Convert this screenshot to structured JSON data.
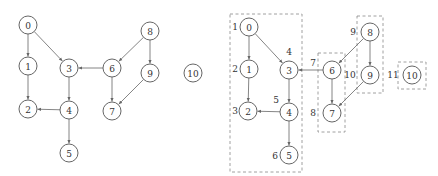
{
  "colors": {
    "node_stroke": "#555555",
    "edge": "#666666",
    "box": "#888888",
    "text": "#333333"
  },
  "left_graph": {
    "nodes": [
      {
        "id": "0",
        "x": 28,
        "y": 25
      },
      {
        "id": "1",
        "x": 28,
        "y": 66
      },
      {
        "id": "2",
        "x": 28,
        "y": 109
      },
      {
        "id": "3",
        "x": 69,
        "y": 68
      },
      {
        "id": "4",
        "x": 69,
        "y": 110
      },
      {
        "id": "5",
        "x": 69,
        "y": 153
      },
      {
        "id": "6",
        "x": 112,
        "y": 68
      },
      {
        "id": "7",
        "x": 112,
        "y": 111
      },
      {
        "id": "8",
        "x": 150,
        "y": 31
      },
      {
        "id": "9",
        "x": 150,
        "y": 73
      },
      {
        "id": "10",
        "x": 193,
        "y": 73
      }
    ],
    "edges": [
      [
        "0",
        "1"
      ],
      [
        "0",
        "3"
      ],
      [
        "1",
        "2"
      ],
      [
        "3",
        "4"
      ],
      [
        "4",
        "2"
      ],
      [
        "4",
        "5"
      ],
      [
        "6",
        "3"
      ],
      [
        "6",
        "7"
      ],
      [
        "8",
        "6"
      ],
      [
        "8",
        "9"
      ],
      [
        "9",
        "7"
      ]
    ]
  },
  "right_graph": {
    "nodes": [
      {
        "id": "0",
        "x": 249,
        "y": 27,
        "order": "1"
      },
      {
        "id": "1",
        "x": 249,
        "y": 69,
        "order": "2"
      },
      {
        "id": "2",
        "x": 248,
        "y": 111,
        "order": "3"
      },
      {
        "id": "3",
        "x": 289,
        "y": 70,
        "order": "4"
      },
      {
        "id": "4",
        "x": 289,
        "y": 112,
        "order": "5"
      },
      {
        "id": "5",
        "x": 289,
        "y": 155,
        "order": "6"
      },
      {
        "id": "6",
        "x": 332,
        "y": 70,
        "order": "7"
      },
      {
        "id": "7",
        "x": 332,
        "y": 113,
        "order": "8"
      },
      {
        "id": "8",
        "x": 370,
        "y": 32,
        "order": "9"
      },
      {
        "id": "9",
        "x": 370,
        "y": 75,
        "order": "10"
      },
      {
        "id": "10",
        "x": 412,
        "y": 75,
        "order": "11"
      }
    ],
    "order_labels": [
      {
        "text": "1",
        "x": 235,
        "y": 27
      },
      {
        "text": "2",
        "x": 235,
        "y": 69
      },
      {
        "text": "3",
        "x": 235,
        "y": 111
      },
      {
        "text": "4",
        "x": 289,
        "y": 52
      },
      {
        "text": "5",
        "x": 276,
        "y": 100
      },
      {
        "text": "6",
        "x": 275,
        "y": 156
      },
      {
        "text": "7",
        "x": 313,
        "y": 63
      },
      {
        "text": "8",
        "x": 313,
        "y": 113
      },
      {
        "text": "9",
        "x": 353,
        "y": 32
      },
      {
        "text": "10",
        "x": 350,
        "y": 75
      },
      {
        "text": "11",
        "x": 393,
        "y": 75
      }
    ],
    "edges": [
      [
        "0",
        "1"
      ],
      [
        "0",
        "3"
      ],
      [
        "1",
        "2"
      ],
      [
        "3",
        "4"
      ],
      [
        "4",
        "2"
      ],
      [
        "4",
        "5"
      ],
      [
        "6",
        "3"
      ],
      [
        "6",
        "7"
      ],
      [
        "8",
        "6"
      ],
      [
        "8",
        "9"
      ],
      [
        "9",
        "7"
      ]
    ],
    "components": [
      {
        "name": "component-0-5",
        "x": 230,
        "y": 14,
        "w": 72,
        "h": 158
      },
      {
        "name": "component-6-7",
        "x": 318,
        "y": 53,
        "w": 27,
        "h": 79
      },
      {
        "name": "component-8-9",
        "x": 357,
        "y": 16,
        "w": 26,
        "h": 77
      },
      {
        "name": "component-10",
        "x": 398,
        "y": 62,
        "w": 28,
        "h": 27
      }
    ]
  },
  "node_radius": 9
}
